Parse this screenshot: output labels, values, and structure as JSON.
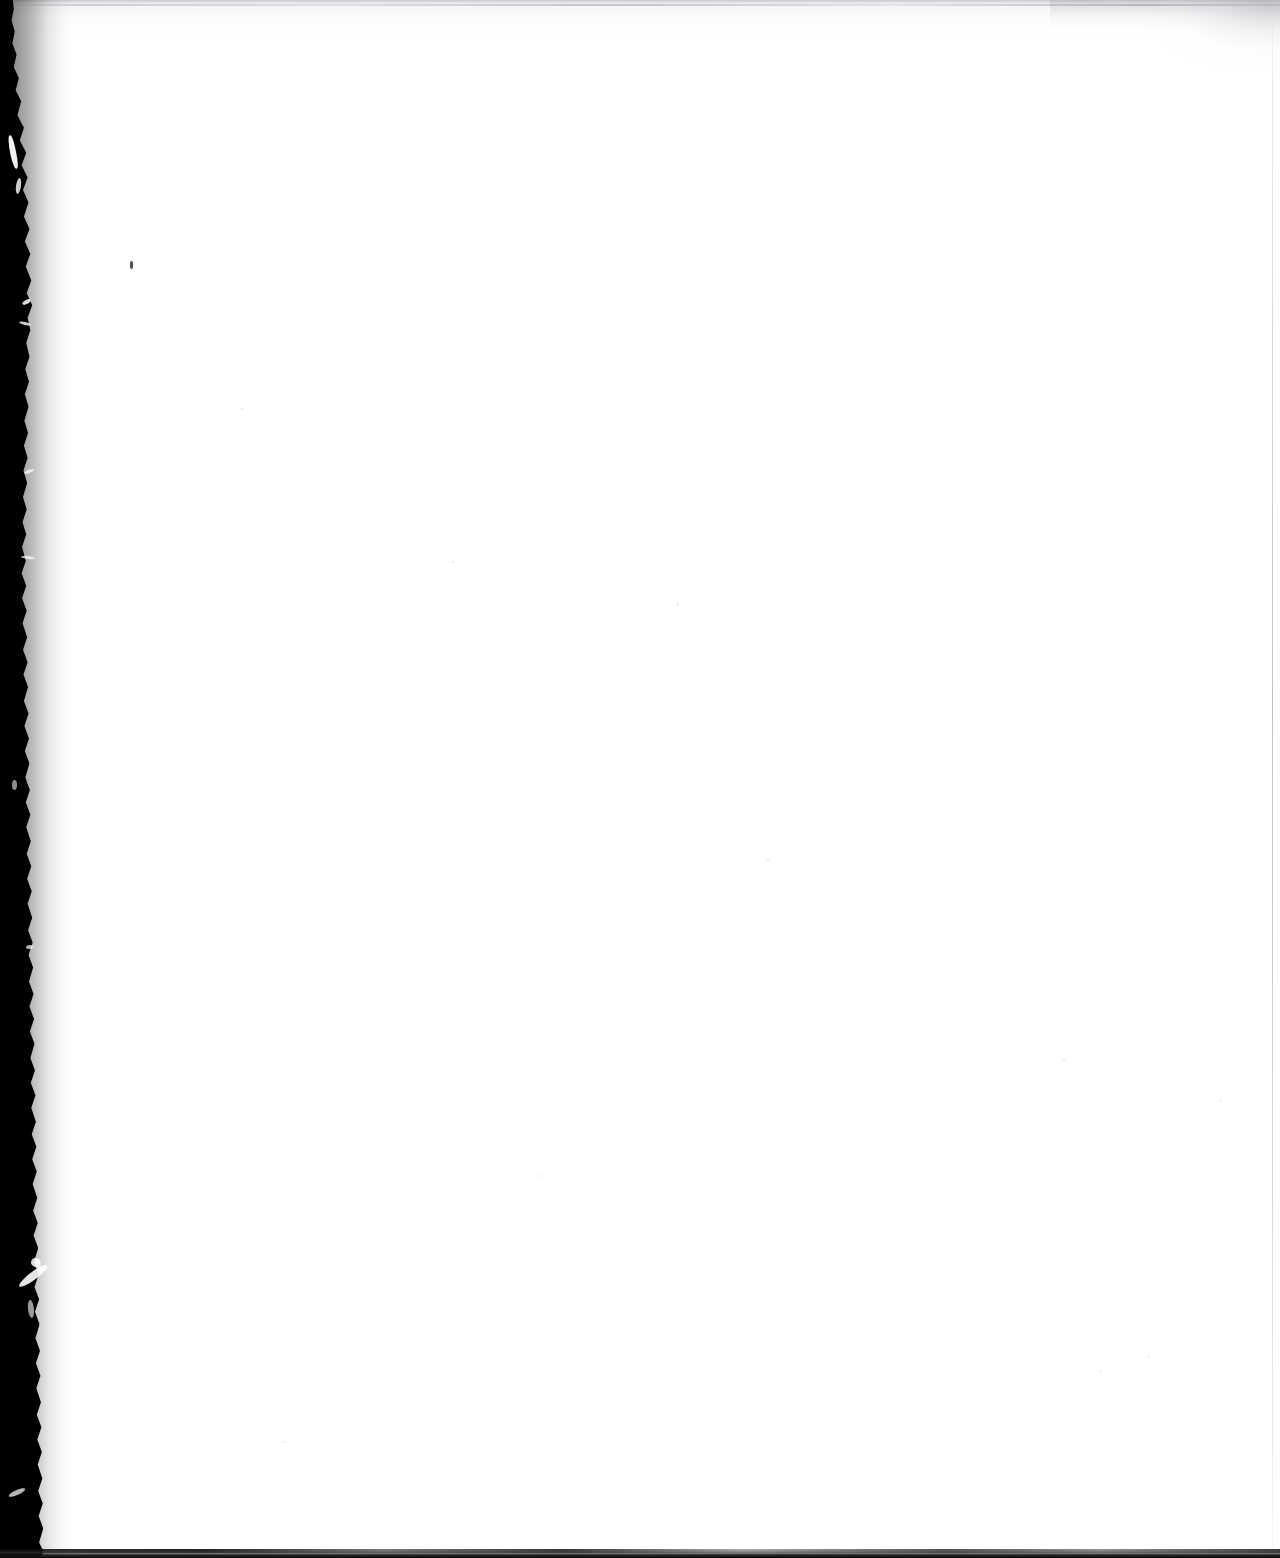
{
  "document": {
    "kind": "scanned-page",
    "page_state": "blank",
    "visible_text": "",
    "caption": ""
  },
  "canvas": {
    "width_px": 1280,
    "height_px": 1558,
    "paper_color": "#ffffff"
  },
  "artifacts": {
    "binding_gutter": {
      "name": "left-binding-gutter",
      "edge": "left",
      "color": "#000000",
      "approx_width_px": 46,
      "description": ""
    },
    "top_scan_line": {
      "name": "top-scan-line",
      "color": "#bec0c4",
      "approx_height_px": 5
    },
    "bottom_dark_band": {
      "name": "bottom-dark-band",
      "color": "#0a0a0b",
      "approx_height_px": 8
    },
    "right_edge_rule": {
      "name": "right-edge-rule",
      "color": "#acaeb4",
      "x_px": 1272
    },
    "corner_smudge": {
      "name": "top-right-corner-smudge",
      "color": "#96989e"
    },
    "ink_speck": {
      "name": "ink-speck",
      "color": "#3a3a3e",
      "x_px": 130,
      "y_px": 261
    }
  }
}
